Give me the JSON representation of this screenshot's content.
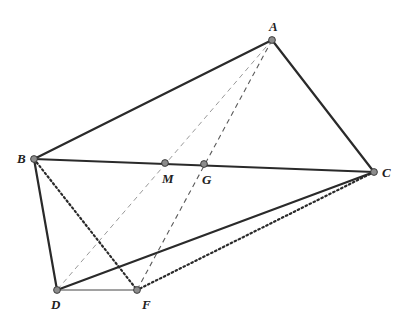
{
  "figure": {
    "type": "geometry-diagram",
    "width": 405,
    "height": 321,
    "colors": {
      "background": "#ffffff",
      "stroke": "#2a2a2a",
      "dashed_light": "#9a9a9a",
      "dashed_dark": "#5a5a5a",
      "point_fill": "#8c8c8c",
      "point_stroke": "#333333"
    },
    "points": [
      {
        "id": "A",
        "label": "A",
        "x": 272,
        "y": 40,
        "label_dx": -3,
        "label_dy": -9
      },
      {
        "id": "B",
        "label": "B",
        "x": 34,
        "y": 159,
        "label_dx": -17,
        "label_dy": 4
      },
      {
        "id": "C",
        "label": "C",
        "x": 374,
        "y": 172,
        "label_dx": 8,
        "label_dy": 5
      },
      {
        "id": "D",
        "label": "D",
        "x": 57,
        "y": 290,
        "label_dx": -6,
        "label_dy": 19
      },
      {
        "id": "F",
        "label": "F",
        "x": 137,
        "y": 290,
        "label_dx": 5,
        "label_dy": 19
      },
      {
        "id": "M",
        "label": "M",
        "x": 165,
        "y": 163,
        "label_dx": -3,
        "label_dy": 20
      },
      {
        "id": "G",
        "label": "G",
        "x": 204,
        "y": 164,
        "label_dx": -2,
        "label_dy": 20
      }
    ],
    "segments": [
      {
        "from": "A",
        "to": "B",
        "style": "solid",
        "width": 2.2
      },
      {
        "from": "A",
        "to": "C",
        "style": "solid",
        "width": 2.2
      },
      {
        "from": "B",
        "to": "C",
        "style": "solid",
        "width": 2.2
      },
      {
        "from": "B",
        "to": "D",
        "style": "solid",
        "width": 2.2
      },
      {
        "from": "D",
        "to": "C",
        "style": "solid",
        "width": 2.2
      },
      {
        "from": "D",
        "to": "F",
        "style": "thin",
        "width": 1.0
      },
      {
        "from": "B",
        "to": "F",
        "style": "dotted",
        "width": 2.2
      },
      {
        "from": "C",
        "to": "F",
        "style": "dotted",
        "width": 2.2
      },
      {
        "from": "A",
        "to": "D",
        "style": "dashed-light",
        "width": 1.0
      },
      {
        "from": "A",
        "to": "F",
        "style": "dashed-dark",
        "width": 1.1
      }
    ]
  }
}
